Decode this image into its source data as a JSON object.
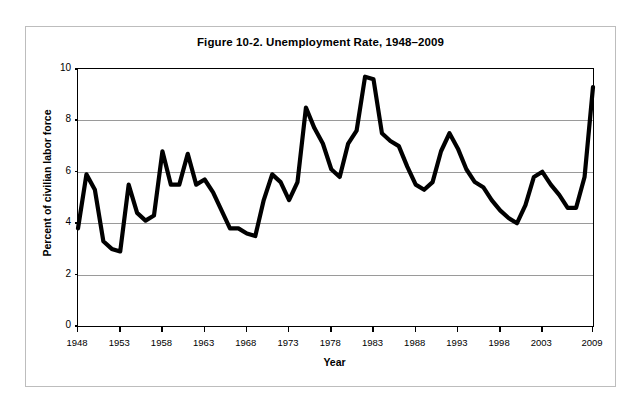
{
  "figure": {
    "title": "Figure 10-2. Unemployment Rate, 1948–2009",
    "xlabel": "Year",
    "ylabel": "Percent of civilian labor force",
    "line_color": "#000000",
    "grid_color": "#9a9a9a",
    "axis_color": "#000000",
    "frame_color": "#bdbdbd",
    "background": "#ffffff"
  },
  "axes": {
    "y_ticks": [
      "0",
      "2",
      "4",
      "6",
      "8",
      "10"
    ],
    "x_ticks": [
      "1948",
      "1953",
      "1958",
      "1963",
      "1968",
      "1973",
      "1978",
      "1983",
      "1988",
      "1993",
      "1998",
      "2003",
      "2009"
    ]
  },
  "chart_data": {
    "type": "line",
    "title": "Figure 10-2. Unemployment Rate, 1948–2009",
    "xlabel": "Year",
    "ylabel": "Percent of civilian labor force",
    "xlim": [
      1948,
      2009
    ],
    "ylim": [
      0,
      10
    ],
    "ytick_interval": 2,
    "grid": "horizontal",
    "legend": "none",
    "x": [
      1948,
      1949,
      1950,
      1951,
      1952,
      1953,
      1954,
      1955,
      1956,
      1957,
      1958,
      1959,
      1960,
      1961,
      1962,
      1963,
      1964,
      1965,
      1966,
      1967,
      1968,
      1969,
      1970,
      1971,
      1972,
      1973,
      1974,
      1975,
      1976,
      1977,
      1978,
      1979,
      1980,
      1981,
      1982,
      1983,
      1984,
      1985,
      1986,
      1987,
      1988,
      1989,
      1990,
      1991,
      1992,
      1993,
      1994,
      1995,
      1996,
      1997,
      1998,
      1999,
      2000,
      2001,
      2002,
      2003,
      2004,
      2005,
      2006,
      2007,
      2008,
      2009
    ],
    "values": [
      3.8,
      5.9,
      5.3,
      3.3,
      3.0,
      2.9,
      5.5,
      4.4,
      4.1,
      4.3,
      6.8,
      5.5,
      5.5,
      6.7,
      5.5,
      5.7,
      5.2,
      4.5,
      3.8,
      3.8,
      3.6,
      3.5,
      4.9,
      5.9,
      5.6,
      4.9,
      5.6,
      8.5,
      7.7,
      7.1,
      6.1,
      5.8,
      7.1,
      7.6,
      9.7,
      9.6,
      7.5,
      7.2,
      7.0,
      6.2,
      5.5,
      5.3,
      5.6,
      6.8,
      7.5,
      6.9,
      6.1,
      5.6,
      5.4,
      4.9,
      4.5,
      4.2,
      4.0,
      4.7,
      5.8,
      6.0,
      5.5,
      5.1,
      4.6,
      4.6,
      5.8,
      9.3
    ],
    "series": [
      {
        "name": "Unemployment Rate",
        "values": [
          3.8,
          5.9,
          5.3,
          3.3,
          3.0,
          2.9,
          5.5,
          4.4,
          4.1,
          4.3,
          6.8,
          5.5,
          5.5,
          6.7,
          5.5,
          5.7,
          5.2,
          4.5,
          3.8,
          3.8,
          3.6,
          3.5,
          4.9,
          5.9,
          5.6,
          4.9,
          5.6,
          8.5,
          7.7,
          7.1,
          6.1,
          5.8,
          7.1,
          7.6,
          9.7,
          9.6,
          7.5,
          7.2,
          7.0,
          6.2,
          5.5,
          5.3,
          5.6,
          6.8,
          7.5,
          6.9,
          6.1,
          5.6,
          5.4,
          4.9,
          4.5,
          4.2,
          4.0,
          4.7,
          5.8,
          6.0,
          5.5,
          5.1,
          4.6,
          4.6,
          5.8,
          9.3
        ]
      }
    ]
  }
}
